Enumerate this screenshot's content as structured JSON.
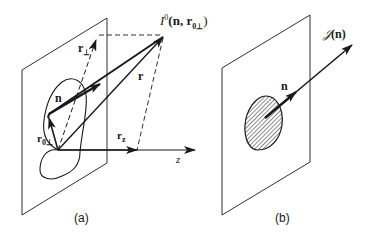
{
  "figure": {
    "panels": [
      {
        "id": "a",
        "caption": "(a)",
        "labels": {
          "intensity": "I",
          "intensity_sup": "0",
          "intensity_args": "(n, r",
          "intensity_args_sub": "0⊥",
          "intensity_close": ")",
          "r_perp": "r",
          "r_perp_sub": "⊥",
          "n": "n",
          "r": "r",
          "r0perp": "r",
          "r0perp_sub": "0⊥",
          "rz": "r",
          "rz_sub": "z",
          "z_axis": "z"
        }
      },
      {
        "id": "b",
        "caption": "(b)",
        "labels": {
          "J": "𝒥",
          "J_args": "(n)",
          "n": "n"
        }
      }
    ],
    "colors": {
      "ink": "#1a1a1a",
      "background": "#ffffff"
    }
  }
}
